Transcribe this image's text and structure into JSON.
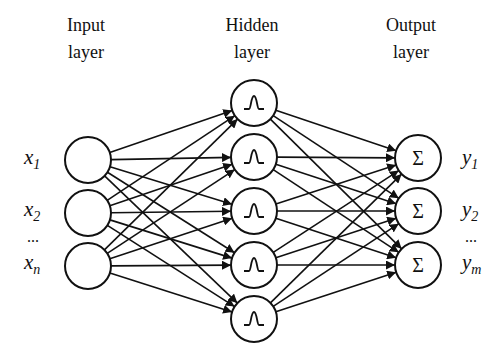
{
  "layers": {
    "input": {
      "title_line1": "Input",
      "title_line2": "layer",
      "node_count": 3
    },
    "hidden": {
      "title_line1": "Hidden",
      "title_line2": "layer",
      "node_count": 5,
      "node_symbol": "gaussian-bump"
    },
    "output": {
      "title_line1": "Output",
      "title_line2": "layer",
      "node_count": 3,
      "node_symbol": "Σ"
    }
  },
  "input_labels": [
    {
      "base": "x",
      "sub": "1"
    },
    {
      "base": "x",
      "sub": "2"
    },
    {
      "base": "x",
      "sub": "n"
    }
  ],
  "output_labels": [
    {
      "base": "y",
      "sub": "1"
    },
    {
      "base": "y",
      "sub": "2"
    },
    {
      "base": "y",
      "sub": "m"
    }
  ],
  "ellipsis": "...",
  "colors": {
    "stroke": "#111111",
    "background": "#ffffff"
  }
}
